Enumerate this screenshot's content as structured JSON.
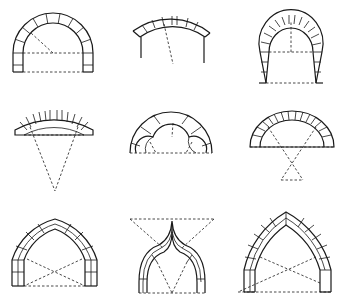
{
  "diagram": {
    "title": "",
    "layout": {
      "rows": 3,
      "cols": 3
    },
    "arches": [
      {
        "id": 1,
        "type": "semicircular (round) arch",
        "row": 1,
        "col": 1
      },
      {
        "id": 2,
        "type": "segmental arch",
        "row": 1,
        "col": 2
      },
      {
        "id": 3,
        "type": "horseshoe arch",
        "row": 1,
        "col": 3
      },
      {
        "id": 4,
        "type": "flat segmental arch",
        "row": 2,
        "col": 1
      },
      {
        "id": 5,
        "type": "trefoil arch",
        "row": 2,
        "col": 2
      },
      {
        "id": 6,
        "type": "segmental arch with crossed centers",
        "row": 2,
        "col": 3
      },
      {
        "id": 7,
        "type": "equilateral pointed arch",
        "row": 3,
        "col": 1
      },
      {
        "id": 8,
        "type": "ogee arch",
        "row": 3,
        "col": 2
      },
      {
        "id": 9,
        "type": "lancet pointed arch",
        "row": 3,
        "col": 3
      }
    ],
    "colors": {
      "line": "#1a1a1a",
      "background": "#ffffff"
    }
  }
}
